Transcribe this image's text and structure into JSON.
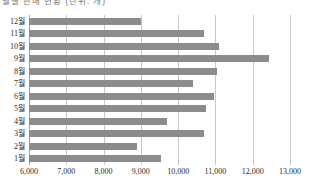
{
  "title": {
    "text": "월별 판매 현황 (단위: 개)",
    "clipped": true
  },
  "chart_data": {
    "type": "bar",
    "orientation": "horizontal",
    "title": "월별 판매 현황 (단위: 개)",
    "xlabel": "",
    "ylabel": "",
    "categories": [
      "12월",
      "11월",
      "10월",
      "9월",
      "8월",
      "7월",
      "6월",
      "5월",
      "4월",
      "3월",
      "2월",
      "1월"
    ],
    "values": [
      9000,
      10700,
      11100,
      12450,
      11050,
      10400,
      10950,
      10750,
      9700,
      10700,
      8900,
      9550
    ],
    "xlim": [
      6000,
      13000
    ],
    "xticks": [
      6000,
      7000,
      8000,
      9000,
      10000,
      11000,
      12000,
      13000
    ],
    "xtick_labels": [
      "6,000",
      "7,000",
      "8,000",
      "9,000",
      "10,000",
      "11,000",
      "12,000",
      "13,000"
    ],
    "grid": true,
    "grid_axis": "x",
    "legend": false,
    "bar_color": "#8c8c8c",
    "gridline_color": "#c9c9c9",
    "background_color": "#ffffff"
  }
}
